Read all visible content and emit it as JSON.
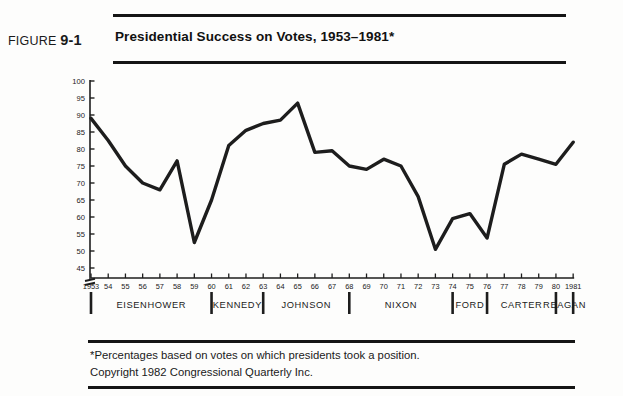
{
  "header": {
    "figure_prefix": "FIGURE",
    "figure_number": "9-1",
    "title": "Presidential Success on Votes, 1953–1981*"
  },
  "footer": {
    "line1": "*Percentages based on votes on which presidents took a position.",
    "line2": "Copyright 1982 Congressional Quarterly Inc."
  },
  "colors": {
    "line": "#1d1d1d",
    "rule": "#151515",
    "text": "#1a1a1a",
    "background": "#fdfdfc"
  },
  "chart_data": {
    "type": "line",
    "title": "Presidential Success on Votes, 1953–1981*",
    "xlabel": "",
    "ylabel": "",
    "ylim": [
      45,
      100
    ],
    "y_axis_break": true,
    "grid": false,
    "legend": "none",
    "yticks": [
      45,
      50,
      55,
      60,
      65,
      70,
      75,
      80,
      85,
      90,
      95,
      100
    ],
    "ytick_labels": [
      "45",
      "50",
      "55",
      "60",
      "65",
      "70",
      "75",
      "80",
      "85",
      "90",
      "95",
      "100"
    ],
    "x": [
      1953,
      1954,
      1955,
      1956,
      1957,
      1958,
      1959,
      1960,
      1961,
      1962,
      1963,
      1964,
      1965,
      1966,
      1967,
      1968,
      1969,
      1970,
      1971,
      1972,
      1973,
      1974,
      1975,
      1976,
      1977,
      1978,
      1979,
      1980,
      1981
    ],
    "xtick_labels": [
      "1953",
      "54",
      "55",
      "56",
      "57",
      "58",
      "59",
      "60",
      "61",
      "62",
      "63",
      "64",
      "65",
      "66",
      "67",
      "68",
      "69",
      "70",
      "71",
      "72",
      "73",
      "74",
      "75",
      "76",
      "77",
      "78",
      "79",
      "80",
      "1981"
    ],
    "values": [
      89.0,
      82.5,
      75.0,
      70.0,
      68.0,
      76.5,
      52.5,
      65.0,
      81.0,
      85.5,
      87.5,
      88.5,
      93.5,
      79.0,
      79.5,
      75.0,
      74.0,
      77.0,
      75.0,
      66.0,
      50.5,
      59.5,
      61.0,
      53.8,
      75.5,
      78.5,
      77.0,
      75.5,
      82.0
    ],
    "series_name": "Presidential success on votes (%)",
    "administrations": [
      {
        "name": "EISENHOWER",
        "start": 1953,
        "end": 1960
      },
      {
        "name": "KENNEDY",
        "start": 1961,
        "end": 1963
      },
      {
        "name": "JOHNSON",
        "start": 1964,
        "end": 1968
      },
      {
        "name": "NIXON",
        "start": 1969,
        "end": 1974
      },
      {
        "name": "FORD",
        "start": 1974,
        "end": 1976
      },
      {
        "name": "CARTER",
        "start": 1977,
        "end": 1980
      },
      {
        "name": "REAGAN",
        "start": 1981,
        "end": 1981
      }
    ],
    "administration_dividers": [
      1953,
      1960,
      1963,
      1968,
      1974,
      1976,
      1980,
      1981
    ]
  }
}
